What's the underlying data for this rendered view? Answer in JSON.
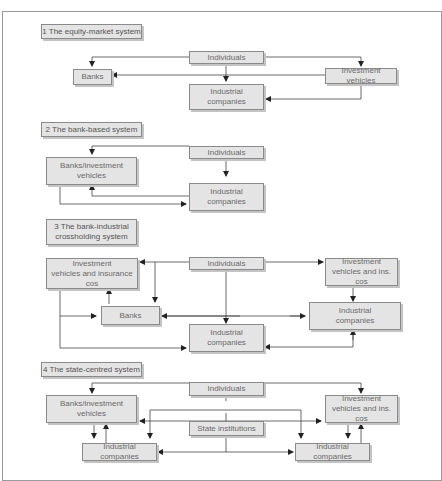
{
  "figure": {
    "title_cropped": "Figure ... Ownership structures ..."
  },
  "colors": {
    "box_fill": "#e4e4e4",
    "box_border": "#8a8a8a",
    "box_shadow": "#c4c4c4",
    "text": "#6a6a6a",
    "line": "#333333",
    "frame": "#9a9a9a"
  },
  "sections": [
    {
      "label": "1 The equity-market system",
      "nodes": {
        "individuals": "Individuals",
        "banks": "Banks",
        "investment": "Investment vehicles",
        "industrial": "Industrial\ncompanies"
      }
    },
    {
      "label": "2 The bank-based system",
      "nodes": {
        "individuals": "Individuals",
        "banks": "Banks/investment\nvehicles",
        "industrial": "Industrial\ncompanies"
      }
    },
    {
      "label": "3 The bank-industrial\ncrossholding system",
      "nodes": {
        "investment_left": "Investment\nvehicles and insurance cos",
        "individuals": "Individuals",
        "investment_right": "Investment\nvehicles and ins. cos",
        "banks": "Banks",
        "industrial_right": "Industrial\ncompanies",
        "industrial_center": "Industrial\ncompanies"
      }
    },
    {
      "label": "4 The state-centred system",
      "nodes": {
        "individuals": "Individuals",
        "banks": "Banks/investment\nvehicles",
        "investment": "Investment\nvehicles and ins. cos",
        "state": "State institutions",
        "industrial_left": "Industrial companies",
        "industrial_right": "Industrial companies"
      }
    }
  ]
}
